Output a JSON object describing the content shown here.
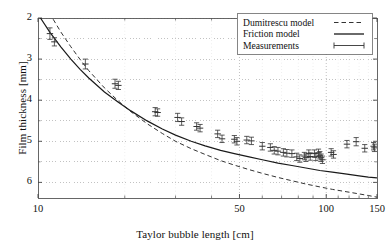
{
  "figure": {
    "background_color": "#ffffff",
    "frame_color": "#555555"
  },
  "axes": {
    "x_title": "Taylor bubble length [cm]",
    "y_title": "Film thickness [mm]",
    "x_ticks": [
      "10",
      "50",
      "100",
      "150"
    ],
    "y_ticks": [
      "6",
      "5",
      "4",
      "3",
      "2"
    ]
  },
  "legend": {
    "items": [
      {
        "label": "Dumitrescu model",
        "style": "dashed"
      },
      {
        "label": "Friction model",
        "style": "solid"
      },
      {
        "label": "Measurements",
        "style": "errorbar"
      }
    ]
  },
  "chart_data": {
    "type": "scatter",
    "title": "",
    "xlabel": "Taylor bubble length [cm]",
    "ylabel": "Film thickness [mm]",
    "xscale": "log",
    "yscale": "linear",
    "xlim": [
      10,
      150
    ],
    "ylim": [
      1.62,
      6.0
    ],
    "grid": true,
    "x_tick_values": [
      10,
      50,
      100,
      150
    ],
    "y_tick_values": [
      2,
      3,
      4,
      5,
      6
    ],
    "y_minor_tick_values": [
      2.5,
      3.5,
      4.5,
      5.5
    ],
    "legend_position": "top-right",
    "series": [
      {
        "name": "Dumitrescu model",
        "type": "line",
        "style": "dashed",
        "color": "#333333",
        "x": [
          10,
          11,
          12,
          13,
          14,
          15,
          17,
          19,
          21,
          24,
          27,
          30,
          34,
          38,
          43,
          48,
          54,
          60,
          68,
          76,
          85,
          95,
          105,
          118,
          130,
          140,
          150
        ],
        "y": [
          6.6,
          6.1,
          5.66,
          5.3,
          4.99,
          4.72,
          4.3,
          3.98,
          3.72,
          3.42,
          3.19,
          3.0,
          2.82,
          2.68,
          2.53,
          2.42,
          2.31,
          2.22,
          2.12,
          2.04,
          1.96,
          1.89,
          1.83,
          1.77,
          1.72,
          1.68,
          1.64
        ]
      },
      {
        "name": "Friction model",
        "type": "line",
        "style": "solid",
        "color": "#1a1a1a",
        "x": [
          10.2,
          11,
          12,
          13,
          14,
          15,
          17,
          19,
          21,
          24,
          27,
          30,
          34,
          38,
          43,
          48,
          54,
          60,
          68,
          76,
          85,
          95,
          105,
          118,
          130,
          140,
          150
        ],
        "y": [
          6.0,
          5.65,
          5.3,
          5.0,
          4.75,
          4.54,
          4.2,
          3.95,
          3.74,
          3.49,
          3.3,
          3.15,
          3.0,
          2.89,
          2.78,
          2.7,
          2.62,
          2.55,
          2.47,
          2.41,
          2.35,
          2.29,
          2.25,
          2.2,
          2.16,
          2.13,
          2.11
        ]
      },
      {
        "name": "Measurements",
        "type": "errorbar",
        "color": "#333333",
        "points": [
          {
            "x": 11.0,
            "y": 5.62,
            "yerr": 0.14
          },
          {
            "x": 11.4,
            "y": 5.42,
            "yerr": 0.1
          },
          {
            "x": 14.6,
            "y": 4.88,
            "yerr": 0.12
          },
          {
            "x": 18.5,
            "y": 4.4,
            "yerr": 0.11
          },
          {
            "x": 19.0,
            "y": 4.36,
            "yerr": 0.1
          },
          {
            "x": 25.5,
            "y": 3.72,
            "yerr": 0.1
          },
          {
            "x": 26.0,
            "y": 3.7,
            "yerr": 0.09
          },
          {
            "x": 30.5,
            "y": 3.58,
            "yerr": 0.1
          },
          {
            "x": 31.5,
            "y": 3.48,
            "yerr": 0.09
          },
          {
            "x": 35.5,
            "y": 3.36,
            "yerr": 0.09
          },
          {
            "x": 36.5,
            "y": 3.32,
            "yerr": 0.09
          },
          {
            "x": 42.0,
            "y": 3.18,
            "yerr": 0.09
          },
          {
            "x": 43.5,
            "y": 3.06,
            "yerr": 0.09
          },
          {
            "x": 48.0,
            "y": 3.05,
            "yerr": 0.09
          },
          {
            "x": 49.0,
            "y": 3.0,
            "yerr": 0.09
          },
          {
            "x": 53.0,
            "y": 3.03,
            "yerr": 0.09
          },
          {
            "x": 55.0,
            "y": 3.01,
            "yerr": 0.09
          },
          {
            "x": 60.0,
            "y": 2.88,
            "yerr": 0.09
          },
          {
            "x": 64.0,
            "y": 2.85,
            "yerr": 0.09
          },
          {
            "x": 66.0,
            "y": 2.78,
            "yerr": 0.09
          },
          {
            "x": 68.0,
            "y": 2.76,
            "yerr": 0.09
          },
          {
            "x": 71.0,
            "y": 2.73,
            "yerr": 0.09
          },
          {
            "x": 73.0,
            "y": 2.71,
            "yerr": 0.09
          },
          {
            "x": 76.0,
            "y": 2.7,
            "yerr": 0.09
          },
          {
            "x": 79.0,
            "y": 2.62,
            "yerr": 0.09
          },
          {
            "x": 81.0,
            "y": 2.58,
            "yerr": 0.09
          },
          {
            "x": 84.0,
            "y": 2.64,
            "yerr": 0.09
          },
          {
            "x": 85.0,
            "y": 2.6,
            "yerr": 0.09
          },
          {
            "x": 87.0,
            "y": 2.7,
            "yerr": 0.09
          },
          {
            "x": 88.0,
            "y": 2.63,
            "yerr": 0.09
          },
          {
            "x": 91.0,
            "y": 2.7,
            "yerr": 0.09
          },
          {
            "x": 92.0,
            "y": 2.62,
            "yerr": 0.09
          },
          {
            "x": 94.0,
            "y": 2.72,
            "yerr": 0.09
          },
          {
            "x": 95.0,
            "y": 2.66,
            "yerr": 0.09
          },
          {
            "x": 96.0,
            "y": 2.6,
            "yerr": 0.09
          },
          {
            "x": 97.0,
            "y": 2.55,
            "yerr": 0.09
          },
          {
            "x": 104.0,
            "y": 2.73,
            "yerr": 0.09
          },
          {
            "x": 106.0,
            "y": 2.68,
            "yerr": 0.09
          },
          {
            "x": 118.0,
            "y": 2.93,
            "yerr": 0.09
          },
          {
            "x": 127.0,
            "y": 2.99,
            "yerr": 0.1
          },
          {
            "x": 136.0,
            "y": 2.83,
            "yerr": 0.09
          },
          {
            "x": 146.0,
            "y": 2.88,
            "yerr": 0.09
          },
          {
            "x": 147.0,
            "y": 2.84,
            "yerr": 0.09
          }
        ]
      }
    ]
  }
}
